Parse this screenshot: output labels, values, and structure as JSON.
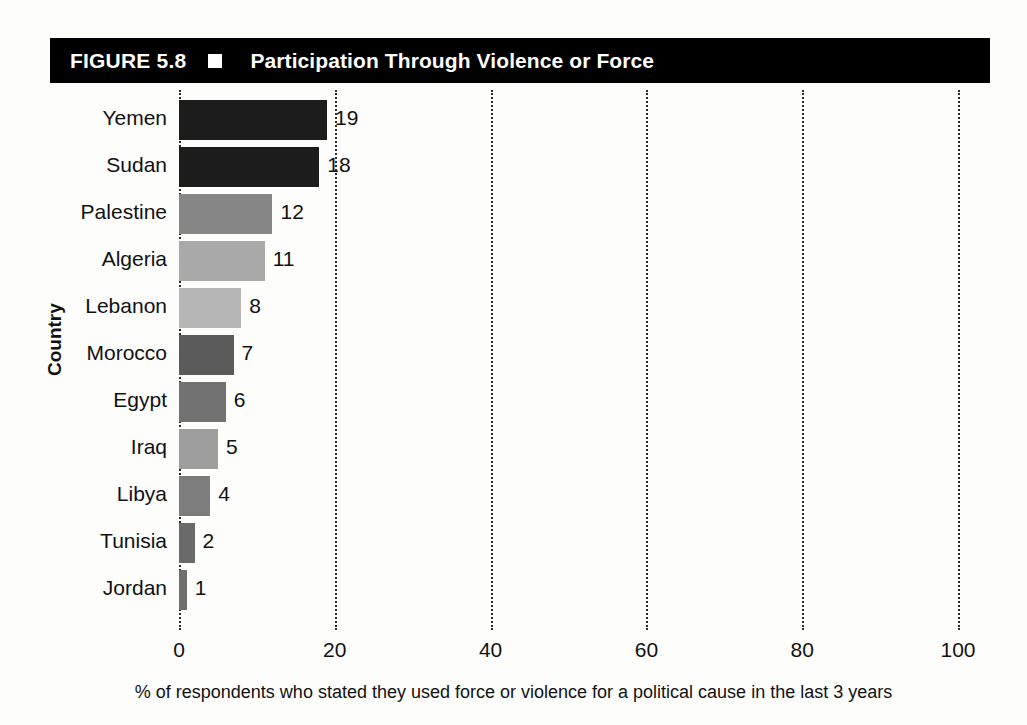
{
  "figure": {
    "number": "FIGURE 5.8",
    "marker": "white-square-bullet",
    "title": "Participation Through Violence or Force"
  },
  "chart_data": {
    "type": "bar",
    "orientation": "horizontal",
    "title": "Participation Through Violence or Force",
    "xlabel": "% of respondents who stated they used force or violence for a political cause in the last 3 years",
    "ylabel": "Country",
    "xlim": [
      0,
      100
    ],
    "xticks": [
      0,
      20,
      40,
      60,
      80,
      100
    ],
    "xtick_labels": [
      "0",
      "20",
      "40",
      "60",
      "80",
      "100"
    ],
    "grid": "vertical-dotted",
    "legend": "none",
    "categories": [
      "Yemen",
      "Sudan",
      "Palestine",
      "Algeria",
      "Lebanon",
      "Morocco",
      "Egypt",
      "Iraq",
      "Libya",
      "Tunisia",
      "Jordan"
    ],
    "values": [
      19,
      18,
      12,
      11,
      8,
      7,
      6,
      5,
      4,
      2,
      1
    ],
    "value_labels": [
      "19",
      "18",
      "12",
      "11",
      "8",
      "7",
      "6",
      "5",
      "4",
      "2",
      "1"
    ],
    "bar_colors": [
      "#1c1c1c",
      "#1c1c1c",
      "#868686",
      "#a9a9a9",
      "#b6b6b6",
      "#5a5a5a",
      "#727272",
      "#9e9e9e",
      "#7d7d7d",
      "#6a6a6a",
      "#6f6f6f"
    ]
  },
  "caption": "% of respondents who stated they used force or violence for a political cause in the last 3 years"
}
